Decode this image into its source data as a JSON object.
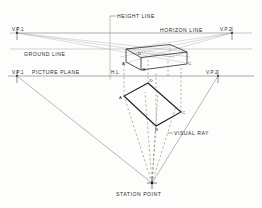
{
  "figure": {
    "background_color": "#fdfdfc",
    "ink_color": "#2a2a2a",
    "faint_ink_color": "#9a9a9a"
  },
  "labels": {
    "height_line": "HEIGHT LINE",
    "horizon_line": "HORIZON LINE",
    "ground_line": "GROUND LINE",
    "picture_plane": "PICTURE PLANE",
    "visual_ray": "VISUAL RAY",
    "station_point": "STATION POINT",
    "vp1_horizon": "V.P.1",
    "vp2_horizon": "V.P.2",
    "vp1_plane": "V.P.1",
    "vp2_plane": "V.P.2",
    "hl": "H.L"
  },
  "point_labels": {
    "box_a": "A",
    "box_b": "B",
    "box_c": "C",
    "box_d": "D",
    "plan_a": "A",
    "plan_b": "B",
    "plan_c": "C",
    "plan_d": "D"
  },
  "geometry": {
    "horizon_line_y": 33,
    "ground_line_y": 49,
    "picture_plane_y": 76,
    "height_line_x": 110,
    "vp1_x": 17,
    "vp2_x": 232,
    "station_point": {
      "x": 152,
      "y": 183
    },
    "box": {
      "front_corner_x": 170,
      "top_front_y": 46,
      "bottom_front_y": 67,
      "left_corner_x": 126,
      "right_corner_x": 187
    },
    "plan_rectangle": [
      {
        "label": "D",
        "x": 148,
        "y": 83
      },
      {
        "label": "A",
        "x": 124,
        "y": 96
      },
      {
        "label": "B",
        "x": 156,
        "y": 126
      },
      {
        "label": "C",
        "x": 181,
        "y": 112
      }
    ]
  }
}
